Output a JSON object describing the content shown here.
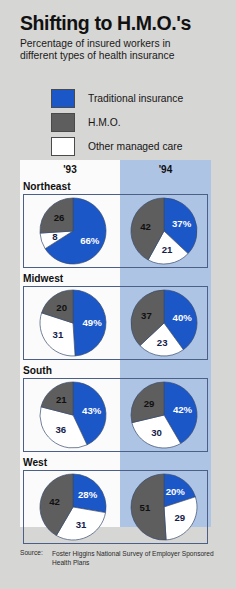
{
  "header": {
    "title": "Shifting to H.M.O.'s",
    "subtitle_line1": "Percentage of insured workers in",
    "subtitle_line2": "different types of health insurance"
  },
  "legend": {
    "items": [
      {
        "label": "Traditional insurance",
        "color": "#1c57c8"
      },
      {
        "label": "H.M.O.",
        "color": "#5e5e5e"
      },
      {
        "label": "Other managed care",
        "color": "#ffffff"
      }
    ]
  },
  "columns": [
    {
      "year": "'93",
      "bg": "#fbfbfb"
    },
    {
      "year": "'94",
      "bg": "#aec4e4"
    }
  ],
  "source": {
    "key": "Source:",
    "text": "Foster Higgins National Survey of Employer Sponsored Health Plans"
  },
  "chart_data": {
    "type": "pie",
    "title": "Shifting to H.M.O.'s",
    "subtitle": "Percentage of insured workers in different types of health insurance",
    "legend": [
      "Traditional insurance",
      "H.M.O.",
      "Other managed care"
    ],
    "legend_position": "top",
    "categories": [
      "Traditional insurance",
      "Other managed care",
      "H.M.O."
    ],
    "colors": [
      "#1c57c8",
      "#ffffff",
      "#5e5e5e"
    ],
    "years": [
      "'93",
      "'94"
    ],
    "regions": [
      "Northeast",
      "Midwest",
      "South",
      "West"
    ],
    "pies": [
      {
        "region": "Northeast",
        "year": "'93",
        "slices": [
          {
            "name": "Traditional insurance",
            "value": 66,
            "label": "66%"
          },
          {
            "name": "Other managed care",
            "value": 8,
            "label": "8"
          },
          {
            "name": "H.M.O.",
            "value": 26,
            "label": "26"
          }
        ]
      },
      {
        "region": "Northeast",
        "year": "'94",
        "slices": [
          {
            "name": "Traditional insurance",
            "value": 37,
            "label": "37%"
          },
          {
            "name": "Other managed care",
            "value": 21,
            "label": "21"
          },
          {
            "name": "H.M.O.",
            "value": 42,
            "label": "42"
          }
        ]
      },
      {
        "region": "Midwest",
        "year": "'93",
        "slices": [
          {
            "name": "Traditional insurance",
            "value": 49,
            "label": "49%"
          },
          {
            "name": "Other managed care",
            "value": 31,
            "label": "31"
          },
          {
            "name": "H.M.O.",
            "value": 20,
            "label": "20"
          }
        ]
      },
      {
        "region": "Midwest",
        "year": "'94",
        "slices": [
          {
            "name": "Traditional insurance",
            "value": 40,
            "label": "40%"
          },
          {
            "name": "Other managed care",
            "value": 23,
            "label": "23"
          },
          {
            "name": "H.M.O.",
            "value": 37,
            "label": "37"
          }
        ]
      },
      {
        "region": "South",
        "year": "'93",
        "slices": [
          {
            "name": "Traditional insurance",
            "value": 43,
            "label": "43%"
          },
          {
            "name": "Other managed care",
            "value": 36,
            "label": "36"
          },
          {
            "name": "H.M.O.",
            "value": 21,
            "label": "21"
          }
        ]
      },
      {
        "region": "South",
        "year": "'94",
        "slices": [
          {
            "name": "Traditional insurance",
            "value": 42,
            "label": "42%"
          },
          {
            "name": "Other managed care",
            "value": 30,
            "label": "30"
          },
          {
            "name": "H.M.O.",
            "value": 29,
            "label": "29"
          }
        ]
      },
      {
        "region": "West",
        "year": "'93",
        "slices": [
          {
            "name": "Traditional insurance",
            "value": 28,
            "label": "28%"
          },
          {
            "name": "Other managed care",
            "value": 31,
            "label": "31"
          },
          {
            "name": "H.M.O.",
            "value": 42,
            "label": "42"
          }
        ]
      },
      {
        "region": "West",
        "year": "'94",
        "slices": [
          {
            "name": "Traditional insurance",
            "value": 20,
            "label": "20%"
          },
          {
            "name": "Other managed care",
            "value": 29,
            "label": "29"
          },
          {
            "name": "H.M.O.",
            "value": 51,
            "label": "51"
          }
        ]
      }
    ]
  }
}
